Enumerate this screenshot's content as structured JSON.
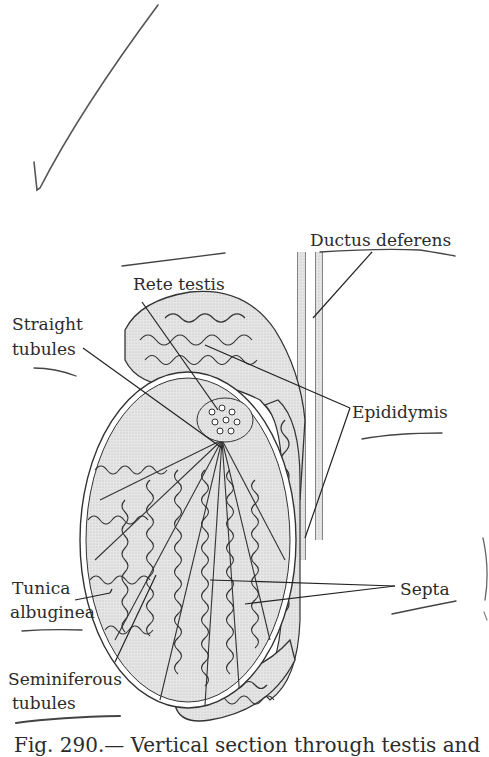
{
  "figure": {
    "caption": "Fig. 290.— Vertical section through testis and",
    "colors": {
      "ink": "#2b2b2b",
      "shading": "#dcdcdc",
      "background": "#ffffff",
      "pen": "#333333"
    }
  },
  "labels": {
    "ductus_deferens": "Ductus deferens",
    "rete_testis": "Rete testis",
    "straight_tubules_1": "Straight",
    "straight_tubules_2": "tubules",
    "epididymis": "Epididymis",
    "tunica_albuginea_1": "Tunica",
    "tunica_albuginea_2": "albuginea",
    "septa": "Septa",
    "seminiferous_tubules_1": "Seminiferous",
    "seminiferous_tubules_2": "tubules"
  },
  "annotations": {
    "checkmark": "handwritten-checkmark",
    "underlines": [
      "ductus-deferens",
      "rete-testis",
      "straight-tubules",
      "epididymis",
      "tunica-albuginea",
      "septa",
      "seminiferous-tubules"
    ]
  }
}
